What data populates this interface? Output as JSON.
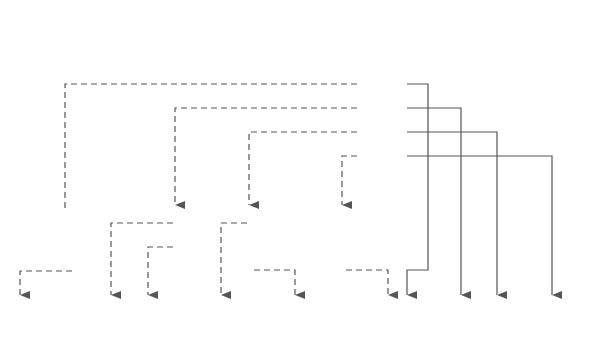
{
  "diagram": {
    "colors": {
      "block_fill": "#d4d4d4",
      "line": "#555555",
      "array_fill": "#ffffff",
      "text": "#333333"
    },
    "v_table": {
      "label": "V",
      "rows": [
        {
          "index": "1",
          "value": ""
        },
        {
          "index": "2",
          "value": ""
        },
        {
          "index": "3",
          "value": "21"
        },
        {
          "index": "4",
          "value": "24"
        },
        {
          "index": "5",
          "value": "26"
        },
        {
          "index": "6",
          "value": "29"
        }
      ]
    },
    "array": {
      "cells": [
        "",
        "54",
        "24",
        "67",
        "92",
        "73",
        "87",
        "48",
        "39",
        "83",
        "58",
        "71",
        "9",
        "16",
        "37",
        "95",
        "79",
        "6",
        "85",
        "63",
        "49",
        "12",
        "60",
        "77",
        "0",
        "5",
        "7",
        "11",
        "0",
        "15",
        "20"
      ],
      "index_labels": [
        "",
        "1",
        "2",
        "3",
        "4",
        "5",
        "6",
        "7",
        "8",
        "9",
        "10",
        "11",
        "12",
        "13",
        "14",
        "15",
        "16",
        "17",
        "18",
        "19",
        "20",
        "21",
        "22",
        "23",
        "24",
        "25",
        "26",
        "27",
        "28",
        "29",
        "30"
      ]
    },
    "blocks": [
      {
        "name": "block-1",
        "x": 47,
        "slashed": [
          true,
          true,
          false
        ]
      },
      {
        "name": "block-2",
        "x": 157,
        "slashed": [
          false,
          false,
          true
        ]
      },
      {
        "name": "block-3",
        "x": 231,
        "slashed": [
          false,
          true,
          false
        ]
      },
      {
        "name": "block-4",
        "x": 323,
        "slashed": [
          true,
          true,
          false
        ]
      }
    ]
  }
}
